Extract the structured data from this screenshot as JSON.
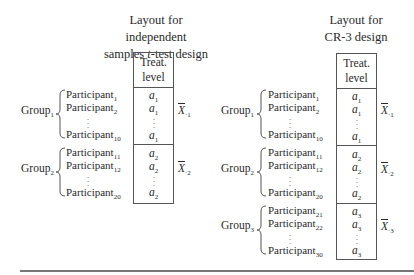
{
  "left_layout": {
    "title_line1": "Layout for independent",
    "title_line2_pre": "samples ",
    "title_line2_italic": "t",
    "title_line2_post": "-test design",
    "header_line1": "Treat.",
    "header_line2": "level",
    "groups": [
      {
        "label": "Group",
        "label_sub": "1",
        "participants": [
          {
            "name": "Participant",
            "sub": "1"
          },
          {
            "name": "Participant",
            "sub": "2"
          },
          {
            "name": "Participant",
            "sub": "10"
          }
        ],
        "cells": [
          {
            "v": "a",
            "sub": "1"
          },
          {
            "v": "a",
            "sub": "1"
          },
          {
            "v": "a",
            "sub": "1"
          }
        ],
        "mean": {
          "symbol": "X",
          "sub": "·1"
        }
      },
      {
        "label": "Group",
        "label_sub": "2",
        "participants": [
          {
            "name": "Participant",
            "sub": "11"
          },
          {
            "name": "Participant",
            "sub": "12"
          },
          {
            "name": "Participant",
            "sub": "20"
          }
        ],
        "cells": [
          {
            "v": "a",
            "sub": "2"
          },
          {
            "v": "a",
            "sub": "2"
          },
          {
            "v": "a",
            "sub": "2"
          }
        ],
        "mean": {
          "symbol": "X",
          "sub": "·2"
        }
      }
    ]
  },
  "right_layout": {
    "title_line1": "Layout for",
    "title_line2": "CR-3 design",
    "header_line1": "Treat.",
    "header_line2": "level",
    "groups": [
      {
        "label": "Group",
        "label_sub": "1",
        "participants": [
          {
            "name": "Participant",
            "sub": "1"
          },
          {
            "name": "Participant",
            "sub": "2"
          },
          {
            "name": "Participant",
            "sub": "10"
          }
        ],
        "cells": [
          {
            "v": "a",
            "sub": "1"
          },
          {
            "v": "a",
            "sub": "1"
          },
          {
            "v": "a",
            "sub": "1"
          }
        ],
        "mean": {
          "symbol": "X",
          "sub": "·1"
        }
      },
      {
        "label": "Group",
        "label_sub": "2",
        "participants": [
          {
            "name": "Participant",
            "sub": "11"
          },
          {
            "name": "Participant",
            "sub": "12"
          },
          {
            "name": "Participant",
            "sub": "20"
          }
        ],
        "cells": [
          {
            "v": "a",
            "sub": "2"
          },
          {
            "v": "a",
            "sub": "2"
          },
          {
            "v": "a",
            "sub": "2"
          }
        ],
        "mean": {
          "symbol": "X",
          "sub": "·2"
        }
      },
      {
        "label": "Group",
        "label_sub": "3",
        "participants": [
          {
            "name": "Participant",
            "sub": "21"
          },
          {
            "name": "Participant",
            "sub": "22"
          },
          {
            "name": "Participant",
            "sub": "30"
          }
        ],
        "cells": [
          {
            "v": "a",
            "sub": "3"
          },
          {
            "v": "a",
            "sub": "3"
          },
          {
            "v": "a",
            "sub": "3"
          }
        ],
        "mean": {
          "symbol": "X",
          "sub": "·3"
        }
      }
    ]
  }
}
